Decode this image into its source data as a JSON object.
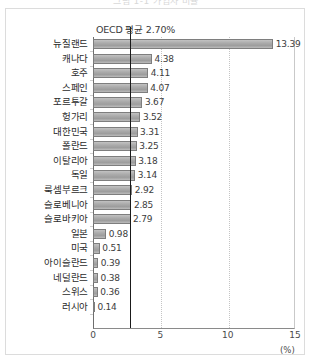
{
  "page": {
    "clipped_title": "그림 1-1 가입자 비율",
    "unit_label": "(%)"
  },
  "annotation": {
    "average_label": "OECD 평균 2.70%",
    "average_value": 2.7
  },
  "axis": {
    "ticks": [
      "0",
      "5",
      "10",
      "15"
    ],
    "tick_values": [
      0,
      5,
      10,
      15
    ],
    "min": 0,
    "max": 15
  },
  "chart_data": {
    "type": "bar",
    "orientation": "horizontal",
    "title": "",
    "xlabel": "(%)",
    "ylabel": "",
    "xlim": [
      0,
      15
    ],
    "grid": true,
    "legend": null,
    "categories": [
      "뉴질랜드",
      "캐나다",
      "호주",
      "스페인",
      "포르투갈",
      "헝가리",
      "대한민국",
      "폴란드",
      "이탈리아",
      "독일",
      "룩셈부르크",
      "슬로베니아",
      "슬로바키아",
      "일본",
      "미국",
      "아이슬란드",
      "네덜란드",
      "스위스",
      "러시아"
    ],
    "values": [
      13.39,
      4.38,
      4.11,
      4.07,
      3.67,
      3.52,
      3.31,
      3.25,
      3.18,
      3.14,
      2.92,
      2.85,
      2.79,
      0.98,
      0.51,
      0.39,
      0.38,
      0.36,
      0.14
    ],
    "value_labels": [
      "13.39",
      "4.38",
      "4.11",
      "4.07",
      "3.67",
      "3.52",
      "3.31",
      "3.25",
      "3.18",
      "3.14",
      "2.92",
      "2.85",
      "2.79",
      "0.98",
      "0.51",
      "0.39",
      "0.38",
      "0.36",
      "0.14"
    ],
    "annotations": [
      {
        "type": "vline",
        "label": "OECD 평균 2.70%",
        "value": 2.7
      }
    ]
  },
  "colors": {
    "bar_fill": "#a8a8a8",
    "bar_border": "#7e7e7e",
    "average_line": "#1a1a1a",
    "gridline": "#c4c4c4",
    "frame": "#dcdcdc",
    "axis": "#6e6e6e",
    "text": "#2b2b2b"
  }
}
